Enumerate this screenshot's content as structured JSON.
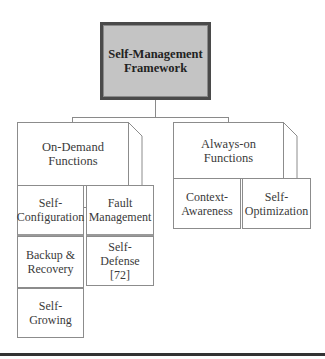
{
  "diagram": {
    "root": {
      "label": "Self-Management Framework",
      "line1": "Self-Management",
      "line2": "Framework"
    },
    "groups": [
      {
        "label": "On-Demand Functions",
        "line1": "On-Demand",
        "line2": "Functions",
        "children": [
          {
            "line1": "Self-",
            "line2": "Configuration"
          },
          {
            "line1": "Fault",
            "line2": "Management"
          },
          {
            "line1": "Backup &",
            "line2": "Recovery"
          },
          {
            "line1": "Self-",
            "line2": "Defense",
            "line3": "[72]"
          },
          {
            "line1": "Self-",
            "line2": "Growing"
          }
        ]
      },
      {
        "label": "Always-on Functions",
        "line1": "Always-on",
        "line2": "Functions",
        "children": [
          {
            "line1": "Context-",
            "line2": "Awareness"
          },
          {
            "line1": "Self-",
            "line2": "Optimization"
          }
        ]
      }
    ],
    "colors": {
      "root_fill": "#c4c4c4",
      "root_border": "#4a4a4a",
      "box_border": "#8c8c8c",
      "connector": "#8a8a8a",
      "rule": "#333333"
    }
  }
}
